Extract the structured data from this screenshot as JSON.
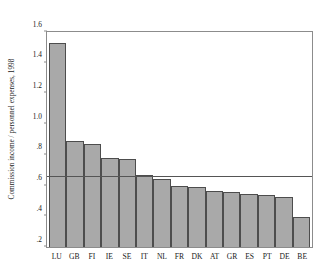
{
  "chart_data": {
    "type": "bar",
    "title": "",
    "subtitle": "",
    "xlabel": "",
    "ylabel": "Commission income / personnel expenses, 1998",
    "categories": [
      "LU",
      "GB",
      "FI",
      "IE",
      "SE",
      "IT",
      "NL",
      "FR",
      "DK",
      "AT",
      "GR",
      "ES",
      "PT",
      "DE",
      "BE"
    ],
    "values": [
      1.53,
      0.89,
      0.87,
      0.78,
      0.77,
      0.67,
      0.645,
      0.6,
      0.59,
      0.565,
      0.56,
      0.545,
      0.54,
      0.525,
      0.395
    ],
    "ylim": [
      0.2,
      1.6
    ],
    "yticks": [
      "1.6",
      "1.4",
      "1.2",
      "1.0",
      ".8",
      ".6",
      ".4",
      ".2"
    ],
    "ytick_values": [
      1.6,
      1.4,
      1.2,
      1.0,
      0.8,
      0.6,
      0.4,
      0.2
    ],
    "grid": false,
    "legend": "none",
    "reference_line": {
      "value": 0.655,
      "label": ""
    },
    "colors": {
      "bar_fill": "#a9a9a9",
      "bar_border": "#4d4d4d",
      "axis": "#8c8c8c",
      "reference_line": "#555555",
      "text": "#1a1a1a",
      "background": "#ffffff"
    }
  }
}
